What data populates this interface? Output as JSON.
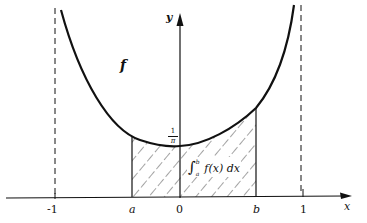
{
  "diagram": {
    "function_label": "f",
    "x_axis_label": "x",
    "y_axis_label": "y",
    "ticks": {
      "neg_one": "-1",
      "a": "a",
      "zero": "0",
      "b": "b",
      "one": "1"
    },
    "min_value_label_num": "1",
    "min_value_label_den": "π",
    "integral_label": "∫",
    "integral_lower": "a",
    "integral_upper": "b",
    "integrand": "f(x) dx",
    "colors": {
      "ink": "#111111",
      "background": "#ffffff"
    }
  }
}
